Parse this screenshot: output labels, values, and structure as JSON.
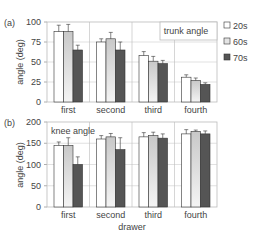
{
  "chart_data": [
    {
      "type": "bar",
      "panel_label": "(a)",
      "title": "trunk angle",
      "xlabel": "",
      "ylabel": "angle (deg)",
      "ylim": [
        0,
        100
      ],
      "yticks": [
        0,
        25,
        50,
        75,
        100
      ],
      "grid": true,
      "categories": [
        "first",
        "second",
        "third",
        "fourth"
      ],
      "series": [
        {
          "name": "20s",
          "values": [
            88,
            75,
            58,
            31
          ],
          "errors": [
            8,
            4,
            5,
            3
          ]
        },
        {
          "name": "60s",
          "values": [
            88,
            79,
            51,
            27
          ],
          "errors": [
            9,
            8,
            6,
            3
          ]
        },
        {
          "name": "70s",
          "values": [
            65,
            65,
            48,
            22
          ],
          "errors": [
            6,
            10,
            4,
            2
          ]
        }
      ]
    },
    {
      "type": "bar",
      "panel_label": "(b)",
      "title": "knee angle",
      "xlabel": "drawer",
      "ylabel": "angle (deg)",
      "ylim": [
        0,
        200
      ],
      "yticks": [
        0,
        50,
        100,
        150,
        200
      ],
      "grid": true,
      "categories": [
        "first",
        "second",
        "third",
        "fourth"
      ],
      "series": [
        {
          "name": "20s",
          "values": [
            145,
            160,
            165,
            172
          ],
          "errors": [
            8,
            8,
            10,
            10
          ]
        },
        {
          "name": "60s",
          "values": [
            145,
            165,
            168,
            178
          ],
          "errors": [
            18,
            8,
            8,
            3
          ]
        },
        {
          "name": "70s",
          "values": [
            100,
            135,
            162,
            172
          ],
          "errors": [
            18,
            28,
            10,
            7
          ]
        }
      ]
    }
  ],
  "legend": {
    "position": "right",
    "items": [
      {
        "label": "20s",
        "color": "#ffffff"
      },
      {
        "label": "60s",
        "color": "#d8d8d8"
      },
      {
        "label": "70s",
        "color": "#555555"
      }
    ]
  }
}
